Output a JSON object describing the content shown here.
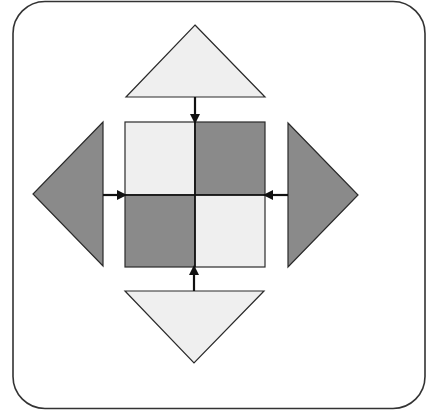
{
  "diagram": {
    "title": "",
    "colors": {
      "background": "#ffffff",
      "frame_stroke": "#333333",
      "light_fill": "#efefef",
      "dark_fill": "#8a8a8a",
      "stroke": "#2a2a2a",
      "arrow": "#111111"
    },
    "central_square": {
      "cells": [
        {
          "position": "top-left",
          "shade": "light"
        },
        {
          "position": "top-right",
          "shade": "dark"
        },
        {
          "position": "bottom-left",
          "shade": "dark"
        },
        {
          "position": "bottom-right",
          "shade": "light"
        }
      ]
    },
    "triangles": [
      {
        "position": "top",
        "points_toward": "up",
        "shade": "light",
        "arrow_direction": "down"
      },
      {
        "position": "right",
        "points_toward": "right",
        "shade": "dark",
        "arrow_direction": "left"
      },
      {
        "position": "bottom",
        "points_toward": "down",
        "shade": "light",
        "arrow_direction": "up"
      },
      {
        "position": "left",
        "points_toward": "left",
        "shade": "dark",
        "arrow_direction": "right"
      }
    ]
  }
}
